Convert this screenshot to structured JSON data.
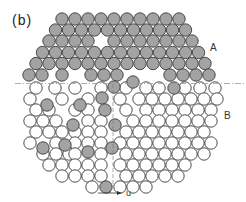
{
  "figure": {
    "panel_label": "(b)",
    "region_labels": [
      {
        "text": "A",
        "x": 210,
        "y": 42
      },
      {
        "text": "B",
        "x": 224,
        "y": 110
      }
    ],
    "vector_label": "u",
    "colors": {
      "grain_a_fill": "#a3a3a3",
      "grain_b_fill": "#ffffff",
      "outline": "#3a3a3a",
      "boundary_line": "#9a9a9a"
    },
    "lattice": {
      "spacing": 13,
      "row_height": 11.2,
      "radius": 6.2
    },
    "boundary": {
      "y": 83.5,
      "x1": 15,
      "x2": 246
    },
    "vertical_trace": {
      "x": 113,
      "y1": 84,
      "y2": 185
    },
    "arrow": {
      "x1": 98,
      "x2": 122,
      "y": 193
    }
  }
}
